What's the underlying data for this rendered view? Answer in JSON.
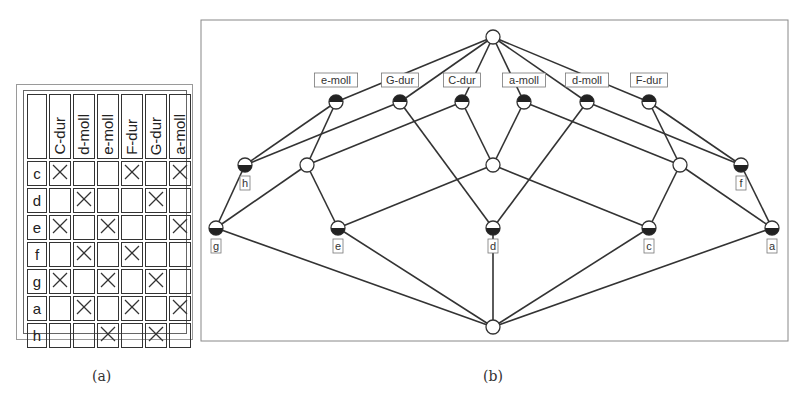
{
  "table": {
    "attributes": [
      "C-dur",
      "d-moll",
      "e-moll",
      "F-dur",
      "G-dur",
      "a-moll"
    ],
    "rows": [
      {
        "object": "c",
        "cells": [
          "X",
          "",
          "",
          "X",
          "",
          "X"
        ]
      },
      {
        "object": "d",
        "cells": [
          "",
          "X",
          "",
          "",
          "X",
          ""
        ]
      },
      {
        "object": "e",
        "cells": [
          "X",
          "",
          "X",
          "",
          "",
          "X"
        ]
      },
      {
        "object": "f",
        "cells": [
          "",
          "X",
          "",
          "X",
          "",
          ""
        ]
      },
      {
        "object": "g",
        "cells": [
          "X",
          "",
          "X",
          "",
          "X",
          ""
        ]
      },
      {
        "object": "a",
        "cells": [
          "",
          "X",
          "",
          "X",
          "",
          "X"
        ]
      },
      {
        "object": "h",
        "cells": [
          "",
          "",
          "X",
          "",
          "X",
          ""
        ]
      }
    ],
    "caption": "(a)"
  },
  "lattice": {
    "caption": "(b)",
    "frame": {
      "x": 201,
      "y": 20,
      "w": 587,
      "h": 321
    },
    "nodes": [
      {
        "id": "top",
        "x": 493,
        "y": 37,
        "type": "plain",
        "label": ""
      },
      {
        "id": "e-moll",
        "x": 336,
        "y": 102,
        "type": "attr",
        "label": "e-moll"
      },
      {
        "id": "G-dur",
        "x": 400,
        "y": 102,
        "type": "attr",
        "label": "G-dur"
      },
      {
        "id": "C-dur",
        "x": 462,
        "y": 102,
        "type": "attr",
        "label": "C-dur"
      },
      {
        "id": "a-moll",
        "x": 524,
        "y": 102,
        "type": "attr",
        "label": "a-moll"
      },
      {
        "id": "d-moll",
        "x": 587,
        "y": 102,
        "type": "attr",
        "label": "d-moll"
      },
      {
        "id": "F-dur",
        "x": 649,
        "y": 102,
        "type": "attr",
        "label": "F-dur"
      },
      {
        "id": "h",
        "x": 245,
        "y": 165,
        "type": "obj",
        "label": "h"
      },
      {
        "id": "w1",
        "x": 307,
        "y": 165,
        "type": "plain",
        "label": ""
      },
      {
        "id": "w2",
        "x": 493,
        "y": 165,
        "type": "plain",
        "label": ""
      },
      {
        "id": "w3",
        "x": 680,
        "y": 165,
        "type": "plain",
        "label": ""
      },
      {
        "id": "f",
        "x": 741,
        "y": 165,
        "type": "obj",
        "label": "f"
      },
      {
        "id": "g",
        "x": 216,
        "y": 228,
        "type": "obj",
        "label": "g"
      },
      {
        "id": "e",
        "x": 338,
        "y": 228,
        "type": "obj",
        "label": "e"
      },
      {
        "id": "d",
        "x": 493,
        "y": 228,
        "type": "obj",
        "label": "d"
      },
      {
        "id": "c",
        "x": 649,
        "y": 228,
        "type": "obj",
        "label": "c"
      },
      {
        "id": "a",
        "x": 772,
        "y": 228,
        "type": "obj",
        "label": "a"
      },
      {
        "id": "bottom",
        "x": 493,
        "y": 327,
        "type": "plain",
        "label": ""
      }
    ],
    "edges": [
      [
        "top",
        "e-moll"
      ],
      [
        "top",
        "G-dur"
      ],
      [
        "top",
        "C-dur"
      ],
      [
        "top",
        "a-moll"
      ],
      [
        "top",
        "d-moll"
      ],
      [
        "top",
        "F-dur"
      ],
      [
        "e-moll",
        "h"
      ],
      [
        "e-moll",
        "w1"
      ],
      [
        "G-dur",
        "h"
      ],
      [
        "G-dur",
        "d"
      ],
      [
        "C-dur",
        "w1"
      ],
      [
        "C-dur",
        "w2"
      ],
      [
        "a-moll",
        "w2"
      ],
      [
        "a-moll",
        "w3"
      ],
      [
        "d-moll",
        "d"
      ],
      [
        "d-moll",
        "f"
      ],
      [
        "F-dur",
        "w3"
      ],
      [
        "F-dur",
        "f"
      ],
      [
        "h",
        "g"
      ],
      [
        "w1",
        "g"
      ],
      [
        "w1",
        "e"
      ],
      [
        "w2",
        "e"
      ],
      [
        "w2",
        "c"
      ],
      [
        "w3",
        "c"
      ],
      [
        "w3",
        "a"
      ],
      [
        "f",
        "a"
      ],
      [
        "g",
        "bottom"
      ],
      [
        "e",
        "bottom"
      ],
      [
        "d",
        "bottom"
      ],
      [
        "c",
        "bottom"
      ],
      [
        "a",
        "bottom"
      ]
    ]
  }
}
